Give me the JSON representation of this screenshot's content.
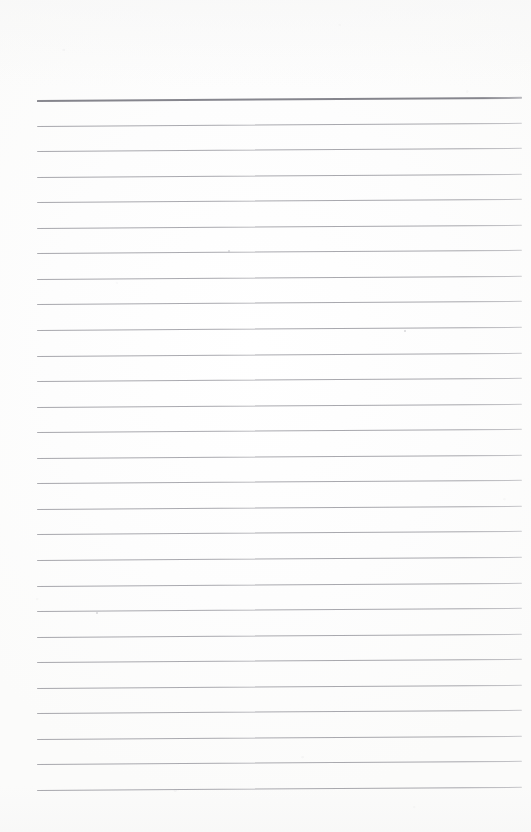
{
  "document": {
    "kind": "scanned-lined-notebook-page",
    "title": "Blank ruled notepad page",
    "page_width": 531,
    "page_height": 832,
    "paper_color": "#fdfdfd",
    "content_text": "",
    "has_handwriting": false,
    "has_printed_text": false
  },
  "ruling": {
    "line_color": "#a6a6ac",
    "header_rule_color": "#84848c",
    "line_count": 27,
    "left_x": 37,
    "right_x": 522,
    "first_line_y": 100,
    "line_pitch": 25.55,
    "tilt_rise_px": -3.2,
    "header_rule_index": 0,
    "lines": [
      {
        "index": 1,
        "y": 100.0,
        "weight": "heavy"
      },
      {
        "index": 2,
        "y": 125.6,
        "weight": "normal"
      },
      {
        "index": 3,
        "y": 151.1,
        "weight": "normal"
      },
      {
        "index": 4,
        "y": 176.7,
        "weight": "normal"
      },
      {
        "index": 5,
        "y": 202.2,
        "weight": "normal"
      },
      {
        "index": 6,
        "y": 227.8,
        "weight": "normal"
      },
      {
        "index": 7,
        "y": 253.3,
        "weight": "normal"
      },
      {
        "index": 8,
        "y": 278.9,
        "weight": "normal"
      },
      {
        "index": 9,
        "y": 304.4,
        "weight": "normal"
      },
      {
        "index": 10,
        "y": 330.0,
        "weight": "normal"
      },
      {
        "index": 11,
        "y": 355.5,
        "weight": "normal"
      },
      {
        "index": 12,
        "y": 381.1,
        "weight": "normal"
      },
      {
        "index": 13,
        "y": 406.6,
        "weight": "normal"
      },
      {
        "index": 14,
        "y": 432.2,
        "weight": "normal"
      },
      {
        "index": 15,
        "y": 457.7,
        "weight": "normal"
      },
      {
        "index": 16,
        "y": 483.3,
        "weight": "normal"
      },
      {
        "index": 17,
        "y": 508.8,
        "weight": "normal"
      },
      {
        "index": 18,
        "y": 534.4,
        "weight": "normal"
      },
      {
        "index": 19,
        "y": 559.9,
        "weight": "normal"
      },
      {
        "index": 20,
        "y": 585.5,
        "weight": "normal"
      },
      {
        "index": 21,
        "y": 611.0,
        "weight": "normal"
      },
      {
        "index": 22,
        "y": 636.6,
        "weight": "normal"
      },
      {
        "index": 23,
        "y": 662.1,
        "weight": "normal"
      },
      {
        "index": 24,
        "y": 687.7,
        "weight": "normal"
      },
      {
        "index": 25,
        "y": 713.2,
        "weight": "normal"
      },
      {
        "index": 26,
        "y": 738.8,
        "weight": "normal"
      },
      {
        "index": 27,
        "y": 764.3,
        "weight": "normal"
      },
      {
        "index": 28,
        "y": 789.9,
        "weight": "normal"
      }
    ]
  },
  "margins": {
    "top_blank_px": 100,
    "bottom_blank_px": 42,
    "left_blank_px": 37,
    "right_blank_px": 9
  },
  "artifacts": {
    "specks": [
      {
        "x": 228,
        "y": 250
      },
      {
        "x": 96,
        "y": 612
      },
      {
        "x": 404,
        "y": 330
      }
    ]
  }
}
